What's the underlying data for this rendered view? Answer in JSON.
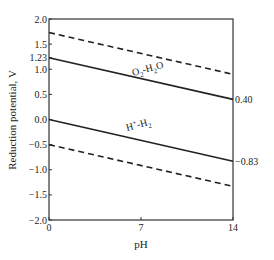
{
  "chart_data": {
    "type": "line",
    "title": "",
    "xlabel": "pH",
    "ylabel": "Reduction potential, V",
    "xlim": [
      0,
      14
    ],
    "ylim": [
      -2.0,
      2.0
    ],
    "grid": false,
    "legend": "none",
    "x_ticks": [
      0,
      7,
      14
    ],
    "x_tick_labels": [
      "0",
      "7",
      "14"
    ],
    "y_ticks": [
      2.0,
      1.5,
      1.23,
      1.0,
      0.5,
      0.0,
      -0.5,
      -1.0,
      -1.5,
      -2.0
    ],
    "y_tick_labels": [
      "2.0",
      "1.5",
      "1.23",
      "1.0",
      "0.5",
      "0.0",
      "−0.5",
      "−1.0",
      "−1.5",
      "−2.0"
    ],
    "right_annotations": [
      {
        "value": 0.4,
        "label": "0.40"
      },
      {
        "value": -0.83,
        "label": "−0.83"
      }
    ],
    "series": [
      {
        "name": "O2 upper (overpotential)",
        "style": "dashed",
        "x": [
          0,
          14
        ],
        "y": [
          1.73,
          0.9
        ]
      },
      {
        "name": "O₂-H₂O",
        "style": "solid",
        "x": [
          0,
          14
        ],
        "y": [
          1.23,
          0.4
        ]
      },
      {
        "name": "H⁺-H₂",
        "style": "solid",
        "x": [
          0,
          14
        ],
        "y": [
          0.0,
          -0.83
        ]
      },
      {
        "name": "H2 lower (overpotential)",
        "style": "dashed",
        "x": [
          0,
          14
        ],
        "y": [
          -0.5,
          -1.33
        ]
      }
    ],
    "line_labels": {
      "o2": {
        "main": "O",
        "sub1": "2",
        "mid": "-H",
        "sub2": "2",
        "end": "O"
      },
      "h2": {
        "main": "H",
        "sup": "+",
        "mid": "-H",
        "sub": "2"
      }
    }
  }
}
